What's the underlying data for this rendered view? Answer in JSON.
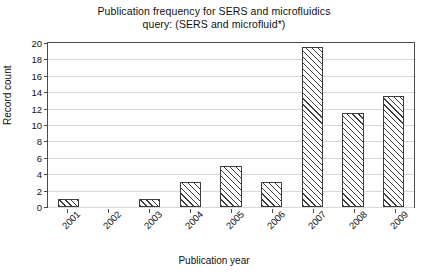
{
  "chart_data": {
    "type": "bar",
    "title": "Publication frequency for SERS and microfluidics",
    "subtitle": "query: (SERS and microfluid*)",
    "xlabel": "Publication year",
    "ylabel": "Record count",
    "categories": [
      "2001",
      "2002",
      "2003",
      "2004",
      "2005",
      "2006",
      "2007",
      "2008",
      "2009"
    ],
    "values": [
      1,
      0,
      1,
      3,
      5,
      3,
      19.5,
      11.5,
      13.5
    ],
    "ylim": [
      0,
      20
    ],
    "ytick_labels": [
      "20",
      "18",
      "16",
      "14",
      "12",
      "10",
      "8",
      "6",
      "4",
      "2",
      "0"
    ],
    "ytick_values": [
      20,
      18,
      16,
      14,
      12,
      10,
      8,
      6,
      4,
      2,
      0
    ],
    "grid": true,
    "legend": false,
    "bar_fill": "hatch-diagonal",
    "bar_edge_color": "#3d3d3d",
    "grid_color": "#d7d7d7",
    "axis_color": "#4a4a4a"
  }
}
